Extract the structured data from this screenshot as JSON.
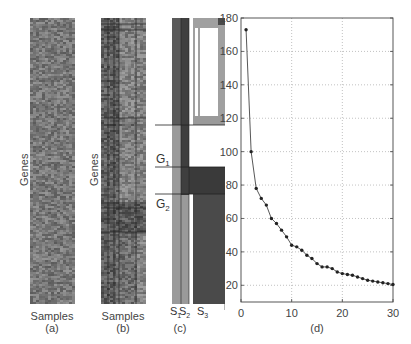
{
  "panels": {
    "a": {
      "ylabel": "Genes",
      "xlabel": "Samples",
      "caption": "(a)"
    },
    "b": {
      "ylabel": "Genes",
      "xlabel": "Samples",
      "caption": "(b)"
    },
    "c": {
      "caption": "(c)",
      "row_labels": [
        "G",
        "G"
      ],
      "row_label_subs": [
        "1",
        "2"
      ],
      "col_labels": [
        "S",
        "S",
        "S"
      ],
      "col_label_subs": [
        "1",
        "2",
        "3"
      ]
    },
    "d": {
      "caption": "(d)"
    }
  },
  "colors": {
    "heatmap_base": "#7a7a7a",
    "dark_block": "#4a4a4a",
    "mid_block": "#8c8c8c",
    "light_block": "#a8a8a8",
    "line": "#444444",
    "grid": "#999999"
  },
  "chart_data": {
    "type": "line",
    "title": "",
    "caption": "(d)",
    "xlabel": "",
    "ylabel": "",
    "xlim": [
      0,
      30
    ],
    "ylim": [
      10,
      180
    ],
    "xticks": [
      0,
      10,
      20,
      30
    ],
    "yticks": [
      20,
      40,
      60,
      80,
      100,
      120,
      140,
      160,
      180
    ],
    "grid": true,
    "markers": true,
    "x": [
      1,
      2,
      3,
      4,
      5,
      6,
      7,
      8,
      9,
      10,
      11,
      12,
      13,
      14,
      15,
      16,
      17,
      18,
      19,
      20,
      21,
      22,
      23,
      24,
      25,
      26,
      27,
      28,
      29,
      30
    ],
    "values": [
      173,
      100,
      78,
      72,
      68,
      60,
      57,
      53,
      49,
      44,
      43,
      41,
      38,
      36,
      33,
      31,
      31,
      30,
      28,
      27,
      26.5,
      26,
      25,
      24,
      23,
      22.5,
      22,
      21.5,
      21,
      20.5
    ]
  }
}
